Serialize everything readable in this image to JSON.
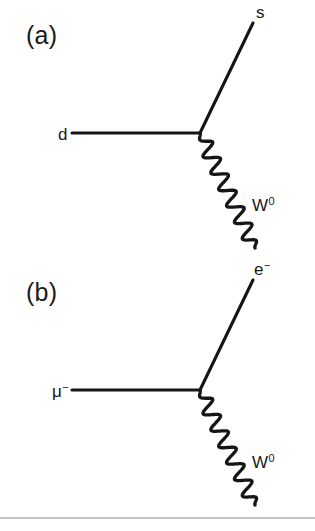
{
  "figure": {
    "caption_panels": [
      "(a)",
      "(b)"
    ],
    "background_color": "#ffffff",
    "ink_color": "#151515",
    "rule_color": "#8a8a8a"
  },
  "diagrams": [
    {
      "panel": "(a)",
      "panel_label_x": 26,
      "panel_label_y": 44,
      "vertex": {
        "x": 200,
        "y": 133
      },
      "incoming": {
        "name": "d-quark-line",
        "label_base": "d",
        "label_sup": "",
        "label_x": 58,
        "label_y": 140,
        "line_start_x": 72,
        "line_start_y": 133,
        "line_end_x": 200,
        "line_end_y": 133
      },
      "outgoing": {
        "name": "s-quark-line",
        "label_base": "s",
        "label_sup": "",
        "label_x": 256,
        "label_y": 18,
        "line_start_x": 200,
        "line_start_y": 133,
        "line_end_x": 253,
        "line_end_y": 23
      },
      "boson": {
        "name": "w-boson-wavy-line",
        "label_base": "W",
        "label_sup": "0",
        "label_x": 252,
        "label_y": 211,
        "start_x": 200,
        "start_y": 133,
        "end_x": 255,
        "end_y": 248,
        "oscillations": 7,
        "amplitude": 7.5
      }
    },
    {
      "panel": "(b)",
      "panel_label_x": 26,
      "panel_label_y": 301,
      "vertex": {
        "x": 200,
        "y": 390
      },
      "incoming": {
        "name": "muon-line",
        "label_base": "μ",
        "label_sup": "−",
        "label_x": 52,
        "label_y": 397,
        "line_start_x": 72,
        "line_start_y": 390,
        "line_end_x": 200,
        "line_end_y": 390
      },
      "outgoing": {
        "name": "electron-line",
        "label_base": "e",
        "label_sup": "−",
        "label_x": 254,
        "label_y": 275,
        "line_start_x": 200,
        "line_start_y": 390,
        "line_end_x": 253,
        "line_end_y": 280
      },
      "boson": {
        "name": "w-boson-wavy-line",
        "label_base": "W",
        "label_sup": "0",
        "label_x": 252,
        "label_y": 468,
        "start_x": 200,
        "start_y": 390,
        "end_x": 255,
        "end_y": 505,
        "oscillations": 7,
        "amplitude": 7.5
      }
    }
  ],
  "footer_rule": {
    "name": "footer-divider",
    "x1": 0,
    "y1": 518,
    "x2": 315,
    "y2": 518
  }
}
